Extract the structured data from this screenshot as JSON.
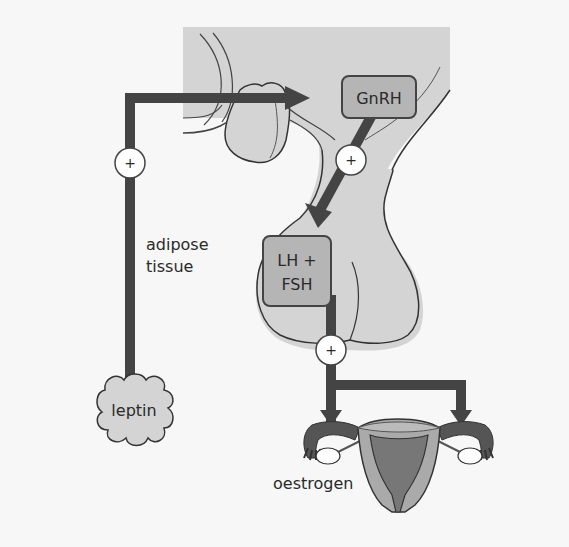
{
  "diagram": {
    "nodes": {
      "gnrh": "GnRH",
      "lh_fsh_line1": "LH +",
      "lh_fsh_line2": "FSH",
      "leptin": "leptin",
      "adipose_line1": "adipose",
      "adipose_line2": "tissue",
      "oestrogen": "oestrogen"
    },
    "stimulation_symbol": "+",
    "edges": [
      {
        "from": "leptin",
        "to": "gnrh",
        "sign": "+"
      },
      {
        "from": "gnrh",
        "to": "lh_fsh",
        "sign": "+"
      },
      {
        "from": "lh_fsh",
        "to": "ovaries",
        "sign": "+"
      }
    ],
    "colors": {
      "background": "#f7f7f7",
      "tissue_fill": "#d4d4d4",
      "box_fill": "#b5b5b5",
      "arrow": "#444444",
      "outline": "#333333"
    }
  }
}
